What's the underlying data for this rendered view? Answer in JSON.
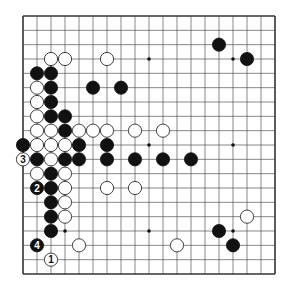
{
  "diagram": {
    "type": "go-board",
    "size": 19,
    "colors": {
      "background": "#ffffff",
      "line": "#555555",
      "black": "#111111",
      "white": "#ffffff"
    },
    "star_points": [
      [
        3,
        3
      ],
      [
        9,
        3
      ],
      [
        15,
        3
      ],
      [
        3,
        9
      ],
      [
        9,
        9
      ],
      [
        15,
        9
      ],
      [
        3,
        15
      ],
      [
        9,
        15
      ],
      [
        15,
        15
      ]
    ],
    "stones": [
      {
        "col": 14,
        "row": 2,
        "color": "black"
      },
      {
        "col": 2,
        "row": 3,
        "color": "white"
      },
      {
        "col": 3,
        "row": 3,
        "color": "white"
      },
      {
        "col": 6,
        "row": 3,
        "color": "white"
      },
      {
        "col": 16,
        "row": 3,
        "color": "black"
      },
      {
        "col": 1,
        "row": 4,
        "color": "black"
      },
      {
        "col": 2,
        "row": 4,
        "color": "black"
      },
      {
        "col": 1,
        "row": 5,
        "color": "white"
      },
      {
        "col": 2,
        "row": 5,
        "color": "black"
      },
      {
        "col": 5,
        "row": 5,
        "color": "black"
      },
      {
        "col": 7,
        "row": 5,
        "color": "black"
      },
      {
        "col": 1,
        "row": 6,
        "color": "white"
      },
      {
        "col": 2,
        "row": 6,
        "color": "black"
      },
      {
        "col": 1,
        "row": 7,
        "color": "white"
      },
      {
        "col": 2,
        "row": 7,
        "color": "black"
      },
      {
        "col": 3,
        "row": 7,
        "color": "black"
      },
      {
        "col": 1,
        "row": 8,
        "color": "white"
      },
      {
        "col": 2,
        "row": 8,
        "color": "white"
      },
      {
        "col": 3,
        "row": 8,
        "color": "black"
      },
      {
        "col": 4,
        "row": 8,
        "color": "white"
      },
      {
        "col": 5,
        "row": 8,
        "color": "white"
      },
      {
        "col": 6,
        "row": 8,
        "color": "white"
      },
      {
        "col": 8,
        "row": 8,
        "color": "white"
      },
      {
        "col": 10,
        "row": 8,
        "color": "white"
      },
      {
        "col": 0,
        "row": 9,
        "color": "black"
      },
      {
        "col": 1,
        "row": 9,
        "color": "white"
      },
      {
        "col": 2,
        "row": 9,
        "color": "white"
      },
      {
        "col": 3,
        "row": 9,
        "color": "white"
      },
      {
        "col": 4,
        "row": 9,
        "color": "black"
      },
      {
        "col": 6,
        "row": 9,
        "color": "black"
      },
      {
        "col": 0,
        "row": 10,
        "color": "white",
        "label": "3"
      },
      {
        "col": 1,
        "row": 10,
        "color": "black"
      },
      {
        "col": 2,
        "row": 10,
        "color": "white"
      },
      {
        "col": 3,
        "row": 10,
        "color": "black"
      },
      {
        "col": 4,
        "row": 10,
        "color": "black"
      },
      {
        "col": 6,
        "row": 10,
        "color": "black"
      },
      {
        "col": 8,
        "row": 10,
        "color": "black"
      },
      {
        "col": 10,
        "row": 10,
        "color": "black"
      },
      {
        "col": 12,
        "row": 10,
        "color": "black"
      },
      {
        "col": 1,
        "row": 11,
        "color": "white"
      },
      {
        "col": 2,
        "row": 11,
        "color": "black"
      },
      {
        "col": 3,
        "row": 11,
        "color": "white"
      },
      {
        "col": 1,
        "row": 12,
        "color": "black",
        "label": "2"
      },
      {
        "col": 2,
        "row": 12,
        "color": "black"
      },
      {
        "col": 3,
        "row": 12,
        "color": "white"
      },
      {
        "col": 6,
        "row": 12,
        "color": "white"
      },
      {
        "col": 8,
        "row": 12,
        "color": "white"
      },
      {
        "col": 2,
        "row": 13,
        "color": "black"
      },
      {
        "col": 3,
        "row": 13,
        "color": "white"
      },
      {
        "col": 2,
        "row": 14,
        "color": "black"
      },
      {
        "col": 3,
        "row": 14,
        "color": "white"
      },
      {
        "col": 16,
        "row": 14,
        "color": "white"
      },
      {
        "col": 2,
        "row": 15,
        "color": "black"
      },
      {
        "col": 14,
        "row": 15,
        "color": "black"
      },
      {
        "col": 1,
        "row": 16,
        "color": "black",
        "label": "4"
      },
      {
        "col": 4,
        "row": 16,
        "color": "white"
      },
      {
        "col": 11,
        "row": 16,
        "color": "white"
      },
      {
        "col": 15,
        "row": 16,
        "color": "black"
      },
      {
        "col": 2,
        "row": 17,
        "color": "white",
        "label": "1"
      }
    ]
  }
}
